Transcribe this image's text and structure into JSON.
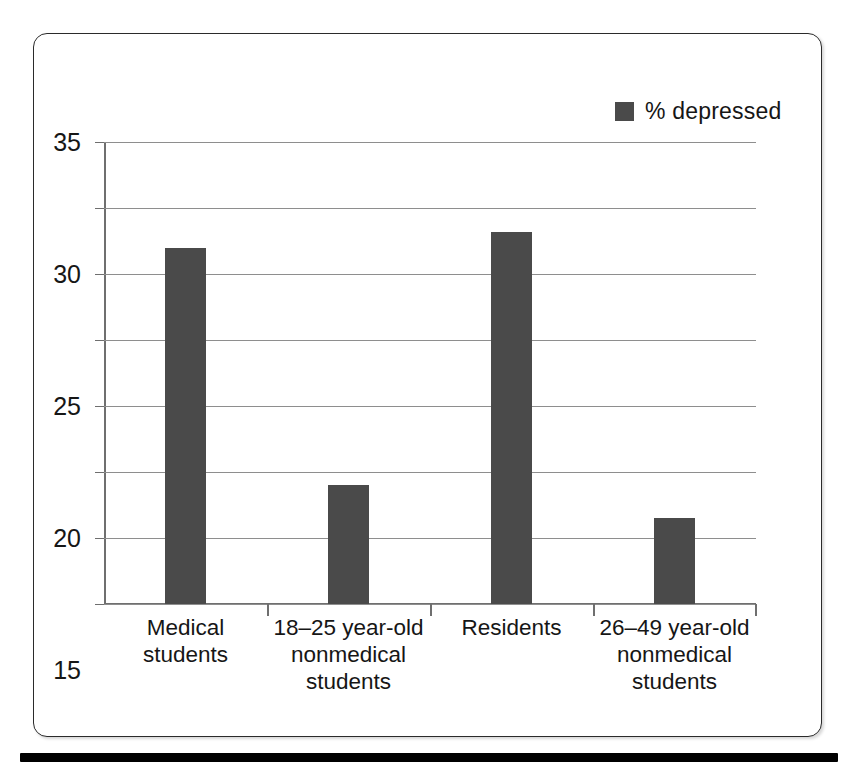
{
  "chart_data": {
    "type": "bar",
    "title": "",
    "subtitle": "",
    "xlabel": "",
    "ylabel": "",
    "categories": [
      "Medical students",
      "18–25 year-old nonmedical students",
      "Residents",
      "26–49 year-old nonmedical students"
    ],
    "category_lines": [
      [
        "Medical",
        "students"
      ],
      [
        "18–25 year-old",
        "nonmedical",
        "students"
      ],
      [
        "Residents"
      ],
      [
        "26–49 year-old",
        "nonmedical",
        "students"
      ]
    ],
    "series": [
      {
        "name": "% depressed",
        "values": [
          27,
          9,
          28.2,
          6.5
        ],
        "color": "#4a4a4a"
      }
    ],
    "ylim": [
      0,
      35
    ],
    "yticks": [
      0,
      5,
      10,
      15,
      20,
      25,
      30,
      35
    ],
    "ytick_labels": [
      "0",
      "5",
      "10",
      "15",
      "20",
      "25",
      "30",
      "35"
    ],
    "grid": true,
    "grid_axis": "y",
    "legend": {
      "position": "top-right",
      "entries": [
        {
          "label": "% depressed",
          "color": "#4a4a4a"
        }
      ]
    },
    "colors": {
      "bar": "#4a4a4a",
      "gridline": "#8e8e8e",
      "axis": "#6f6f6f",
      "frame": "#2b2b2b",
      "rule": "#000000",
      "text": "#161616",
      "background": "#ffffff"
    }
  }
}
